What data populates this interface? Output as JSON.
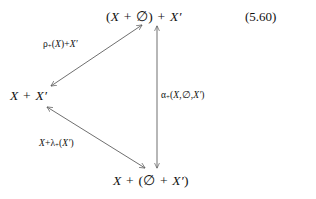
{
  "figure": {
    "kind": "commutative-diagram",
    "shape": "triangle",
    "equation_number": "(5.60)",
    "background_color": "#ffffff",
    "ink_color": "#111111",
    "arrow_color": "#555555"
  },
  "nodes": {
    "top": {
      "id": "node-top",
      "text": "(X + ∅) + X′",
      "position": {
        "x": 106,
        "y": 8
      }
    },
    "left": {
      "id": "node-left",
      "text": "X + X′",
      "position": {
        "x": 10,
        "y": 88
      }
    },
    "bottom": {
      "id": "node-bottom",
      "text": "X + (∅ + X′)",
      "position": {
        "x": 113,
        "y": 172
      }
    }
  },
  "edges": {
    "rho": {
      "id": "edge-rho",
      "label": "ρ₊(X) + X′",
      "from": "left",
      "to": "top",
      "double_headed": true,
      "label_position": {
        "x": 43,
        "y": 39
      }
    },
    "alpha": {
      "id": "edge-alpha",
      "label": "α₊(X,∅,X′)",
      "from": "bottom",
      "to": "top",
      "double_headed": true,
      "label_position": {
        "x": 161,
        "y": 89
      }
    },
    "lambda": {
      "id": "edge-lambda",
      "label": "X + λ₊(X′)",
      "from": "left",
      "to": "bottom",
      "double_headed": true,
      "label_position": {
        "x": 39,
        "y": 138
      }
    }
  }
}
